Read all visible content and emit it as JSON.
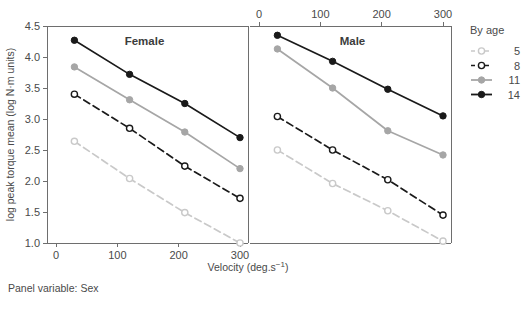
{
  "figure": {
    "footer_note": "Panel variable: Sex",
    "y_axis_title": "log peak torque mean (log N·m units)",
    "x_axis_title_main": "Velocity (deg.s",
    "x_axis_title_sup": "−1",
    "x_axis_title_close": ")",
    "legend_title": "By age"
  },
  "chart_data": {
    "type": "line",
    "title": "",
    "xlabel": "Velocity (deg.s−1)",
    "ylabel": "log peak torque mean (log N·m units)",
    "xlim": [
      -15,
      330
    ],
    "ylim": [
      0.85,
      4.6
    ],
    "x_ticks": [
      0,
      100,
      200,
      300
    ],
    "y_ticks": [
      1.0,
      1.5,
      2.0,
      2.5,
      3.0,
      3.5,
      4.0,
      4.5
    ],
    "y_tick_labels": [
      "1.0",
      "1.5",
      "2.0",
      "2.5",
      "3.0",
      "3.5",
      "4.0",
      "4.5"
    ],
    "x_tick_labels": [
      "0",
      "100",
      "200",
      "300"
    ],
    "grid": false,
    "legend_position": "right",
    "legend_title": "By age",
    "panel_variable": "Sex",
    "x": [
      30,
      120,
      210,
      300
    ],
    "panels": [
      {
        "label": "Female",
        "axis_position": "bottom",
        "series": [
          {
            "name": "5",
            "values": [
              2.64,
              2.04,
              1.49,
              1.0
            ],
            "color": "#c9c9c9",
            "dash": "dashed",
            "marker": "open"
          },
          {
            "name": "8",
            "values": [
              3.4,
              2.85,
              2.24,
              1.72
            ],
            "color": "#1a1a1a",
            "dash": "dashed",
            "marker": "open"
          },
          {
            "name": "11",
            "values": [
              3.84,
              3.31,
              2.79,
              2.2
            ],
            "color": "#a6a6a6",
            "dash": "solid",
            "marker": "filled"
          },
          {
            "name": "14",
            "values": [
              4.27,
              3.72,
              3.25,
              2.7
            ],
            "color": "#1a1a1a",
            "dash": "solid",
            "marker": "filled"
          }
        ]
      },
      {
        "label": "Male",
        "axis_position": "top",
        "series": [
          {
            "name": "5",
            "values": [
              2.5,
              1.96,
              1.52,
              1.03
            ],
            "color": "#c9c9c9",
            "dash": "dashed",
            "marker": "open"
          },
          {
            "name": "8",
            "values": [
              3.04,
              2.5,
              2.02,
              1.45
            ],
            "color": "#1a1a1a",
            "dash": "dashed",
            "marker": "open"
          },
          {
            "name": "11",
            "values": [
              4.13,
              3.5,
              2.81,
              2.42
            ],
            "color": "#a6a6a6",
            "dash": "solid",
            "marker": "filled"
          },
          {
            "name": "14",
            "values": [
              4.35,
              3.93,
              3.48,
              3.05
            ],
            "color": "#1a1a1a",
            "dash": "solid",
            "marker": "filled"
          }
        ]
      }
    ],
    "legend_entries": [
      {
        "label": "5",
        "color": "#c9c9c9",
        "dash": "dashed",
        "marker": "open"
      },
      {
        "label": "8",
        "color": "#1a1a1a",
        "dash": "dashed",
        "marker": "open"
      },
      {
        "label": "11",
        "color": "#a6a6a6",
        "dash": "solid",
        "marker": "filled"
      },
      {
        "label": "14",
        "color": "#1a1a1a",
        "dash": "solid",
        "marker": "filled"
      }
    ]
  }
}
